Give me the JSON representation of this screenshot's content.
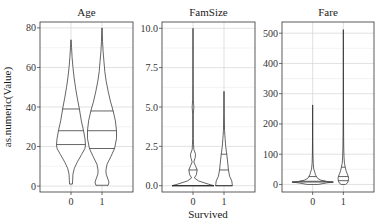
{
  "chart_data": {
    "type": "violin",
    "ylabel": "as.numeric(Value)",
    "xlabel": "Survived",
    "categories": [
      "0",
      "1"
    ],
    "grid": true,
    "facets": [
      {
        "title": "Age",
        "ylim": [
          -3,
          83
        ],
        "yticks": [
          0,
          20,
          40,
          60,
          80
        ],
        "ytick_labels": [
          "0",
          "20",
          "40",
          "60",
          "80"
        ],
        "groups": [
          {
            "category": "0",
            "range": [
              1,
              74
            ],
            "quantiles": [
              21,
              28,
              39
            ],
            "density": [
              [
                1,
                0.05
              ],
              [
                3,
                0.06
              ],
              [
                6,
                0.07
              ],
              [
                9,
                0.12
              ],
              [
                12,
                0.22
              ],
              [
                16,
                0.38
              ],
              [
                19,
                0.5
              ],
              [
                21,
                0.52
              ],
              [
                24,
                0.5
              ],
              [
                28,
                0.45
              ],
              [
                33,
                0.37
              ],
              [
                39,
                0.3
              ],
              [
                45,
                0.22
              ],
              [
                50,
                0.16
              ],
              [
                55,
                0.11
              ],
              [
                60,
                0.07
              ],
              [
                65,
                0.04
              ],
              [
                70,
                0.02
              ],
              [
                74,
                0.0
              ]
            ]
          },
          {
            "category": "1",
            "range": [
              0.4,
              80
            ],
            "quantiles": [
              19,
              28,
              38
            ],
            "density": [
              [
                0.4,
                0.22
              ],
              [
                2,
                0.25
              ],
              [
                4,
                0.2
              ],
              [
                6,
                0.15
              ],
              [
                8,
                0.14
              ],
              [
                11,
                0.18
              ],
              [
                15,
                0.32
              ],
              [
                19,
                0.45
              ],
              [
                24,
                0.52
              ],
              [
                28,
                0.52
              ],
              [
                33,
                0.48
              ],
              [
                38,
                0.4
              ],
              [
                43,
                0.3
              ],
              [
                48,
                0.22
              ],
              [
                53,
                0.15
              ],
              [
                58,
                0.1
              ],
              [
                63,
                0.07
              ],
              [
                68,
                0.04
              ],
              [
                73,
                0.02
              ],
              [
                80,
                0.0
              ]
            ]
          }
        ]
      },
      {
        "title": "FamSize",
        "ylim": [
          -0.4,
          10.4
        ],
        "yticks": [
          0,
          2.5,
          5,
          7.5,
          10
        ],
        "ytick_labels": [
          "0.0",
          "2.5",
          "5.0",
          "7.5",
          "10.0"
        ],
        "groups": [
          {
            "category": "0",
            "range": [
              0,
              10
            ],
            "quantiles": [
              0,
              0,
              1
            ],
            "density": [
              [
                0,
                0.75
              ],
              [
                0.1,
                0.55
              ],
              [
                0.3,
                0.2
              ],
              [
                0.5,
                0.05
              ],
              [
                0.7,
                0.12
              ],
              [
                1.0,
                0.15
              ],
              [
                1.3,
                0.08
              ],
              [
                1.5,
                0.03
              ],
              [
                1.8,
                0.08
              ],
              [
                2.0,
                0.09
              ],
              [
                2.3,
                0.03
              ],
              [
                2.6,
                0.02
              ],
              [
                3.0,
                0.01
              ],
              [
                4.5,
                0.01
              ],
              [
                5.0,
                0.03
              ],
              [
                5.5,
                0.01
              ],
              [
                6.5,
                0.005
              ],
              [
                10,
                0.0
              ]
            ]
          },
          {
            "category": "1",
            "range": [
              0,
              6
            ],
            "quantiles": [
              0,
              1,
              2
            ],
            "density": [
              [
                0,
                0.3
              ],
              [
                0.3,
                0.28
              ],
              [
                0.6,
                0.2
              ],
              [
                1.0,
                0.16
              ],
              [
                1.5,
                0.13
              ],
              [
                2.0,
                0.1
              ],
              [
                2.5,
                0.06
              ],
              [
                3.0,
                0.04
              ],
              [
                3.5,
                0.02
              ],
              [
                4.5,
                0.01
              ],
              [
                6,
                0.0
              ]
            ]
          }
        ]
      },
      {
        "title": "Fare",
        "ylim": [
          -25,
          537
        ],
        "yticks": [
          0,
          100,
          200,
          300,
          400,
          500
        ],
        "ytick_labels": [
          "0",
          "100",
          "200",
          "300",
          "400",
          "500"
        ],
        "groups": [
          {
            "category": "0",
            "range": [
              0,
              263
            ],
            "quantiles": [
              7.9,
              10.5,
              26
            ],
            "density": [
              [
                0,
                0.2
              ],
              [
                5,
                0.5
              ],
              [
                8,
                0.75
              ],
              [
                10,
                0.5
              ],
              [
                14,
                0.3
              ],
              [
                20,
                0.18
              ],
              [
                26,
                0.14
              ],
              [
                32,
                0.1
              ],
              [
                40,
                0.08
              ],
              [
                50,
                0.04
              ],
              [
                70,
                0.02
              ],
              [
                100,
                0.01
              ],
              [
                150,
                0.005
              ],
              [
                263,
                0.0
              ]
            ]
          },
          {
            "category": "1",
            "range": [
              0,
              512
            ],
            "quantiles": [
              12.5,
              26,
              57
            ],
            "density": [
              [
                0,
                0.08
              ],
              [
                5,
                0.15
              ],
              [
                12,
                0.18
              ],
              [
                20,
                0.19
              ],
              [
                26,
                0.18
              ],
              [
                35,
                0.14
              ],
              [
                45,
                0.1
              ],
              [
                57,
                0.07
              ],
              [
                70,
                0.04
              ],
              [
                90,
                0.025
              ],
              [
                120,
                0.015
              ],
              [
                160,
                0.01
              ],
              [
                250,
                0.005
              ],
              [
                512,
                0.0
              ]
            ]
          }
        ]
      }
    ]
  }
}
